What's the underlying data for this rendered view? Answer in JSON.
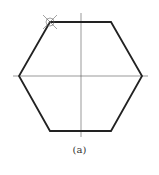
{
  "figure": {
    "caption": "(a)",
    "shape": "regular-hexagon",
    "vertices": [
      [
        50,
        22
      ],
      [
        111,
        22
      ],
      [
        142,
        76
      ],
      [
        111,
        131
      ],
      [
        50,
        131
      ],
      [
        19,
        76
      ]
    ],
    "center_lines": {
      "vertical": {
        "x": 81,
        "y1": 13,
        "y2": 137
      },
      "horizontal": {
        "y": 76,
        "x1": 13,
        "x2": 148
      }
    },
    "marker": {
      "type": "compass-point",
      "cx": 50,
      "cy": 22,
      "r": 4
    },
    "colors": {
      "outline": "#222222",
      "center_line": "#555555",
      "marker": "#666666"
    }
  }
}
